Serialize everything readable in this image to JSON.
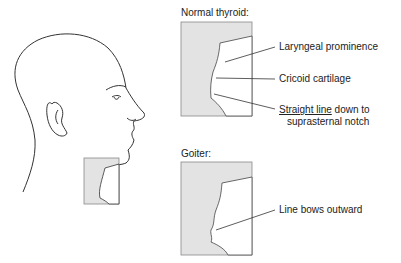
{
  "figure": {
    "normal_panel": {
      "title": "Normal thyroid:",
      "labels": [
        "Laryngeal prominence",
        "Cricoid cartilage"
      ],
      "line_label_underlined": "Straight line",
      "line_label_rest": " down to",
      "line_label_line2": "suprasternal notch"
    },
    "goiter_panel": {
      "title": "Goiter:",
      "labels": [
        "Line bows outward"
      ]
    },
    "colors": {
      "inset_fill": "#e3e3e3",
      "line": "#333333",
      "box_border": "#888888"
    }
  }
}
